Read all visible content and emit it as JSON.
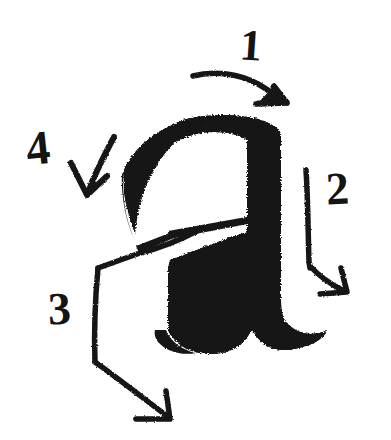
{
  "canvas": {
    "width": 391,
    "height": 440,
    "background_color": "#ffffff",
    "ink_color": "#141414",
    "medium": "hand-drawn marker sketch"
  },
  "glyph": {
    "name": "letter-a",
    "character": "a",
    "style": "bold blackletter / textura lowercase a",
    "description": "heavy rough-textured brush drawn lowercase letter a with arched top bowl, thick vertical stem on the right and a flared foot serif extending to the right"
  },
  "annotations": {
    "title": "stroke order",
    "count": 4,
    "items": [
      {
        "number": "1",
        "label_position": {
          "x": 240,
          "y": 24
        },
        "arrow": {
          "name": "stroke-arrow-1",
          "shape": "curved",
          "start": {
            "x": 193,
            "y": 75
          },
          "end": {
            "x": 285,
            "y": 101
          },
          "direction": "down-right",
          "describes": "top arch stroke drawn left to right"
        }
      },
      {
        "number": "2",
        "label_position": {
          "x": 326,
          "y": 166
        },
        "arrow": {
          "name": "stroke-arrow-2",
          "shape": "elbow",
          "start": {
            "x": 307,
            "y": 170
          },
          "end": {
            "x": 344,
            "y": 290
          },
          "direction": "down-then-right",
          "describes": "right vertical stem drawn downward"
        }
      },
      {
        "number": "3",
        "label_position": {
          "x": 48,
          "y": 286
        },
        "arrow": {
          "name": "stroke-arrow-3",
          "shape": "bracket",
          "start": {
            "x": 196,
            "y": 231
          },
          "end": {
            "x": 167,
            "y": 417
          },
          "direction": "left-down-then-right",
          "describes": "lower bowl and foot stroke"
        }
      },
      {
        "number": "4",
        "label_position": {
          "x": 26,
          "y": 124
        },
        "arrow": {
          "name": "stroke-arrow-4",
          "shape": "curved-short",
          "start": {
            "x": 113,
            "y": 137
          },
          "end": {
            "x": 86,
            "y": 192
          },
          "direction": "down-left",
          "describes": "left arc terminal drawn downward"
        }
      }
    ]
  }
}
